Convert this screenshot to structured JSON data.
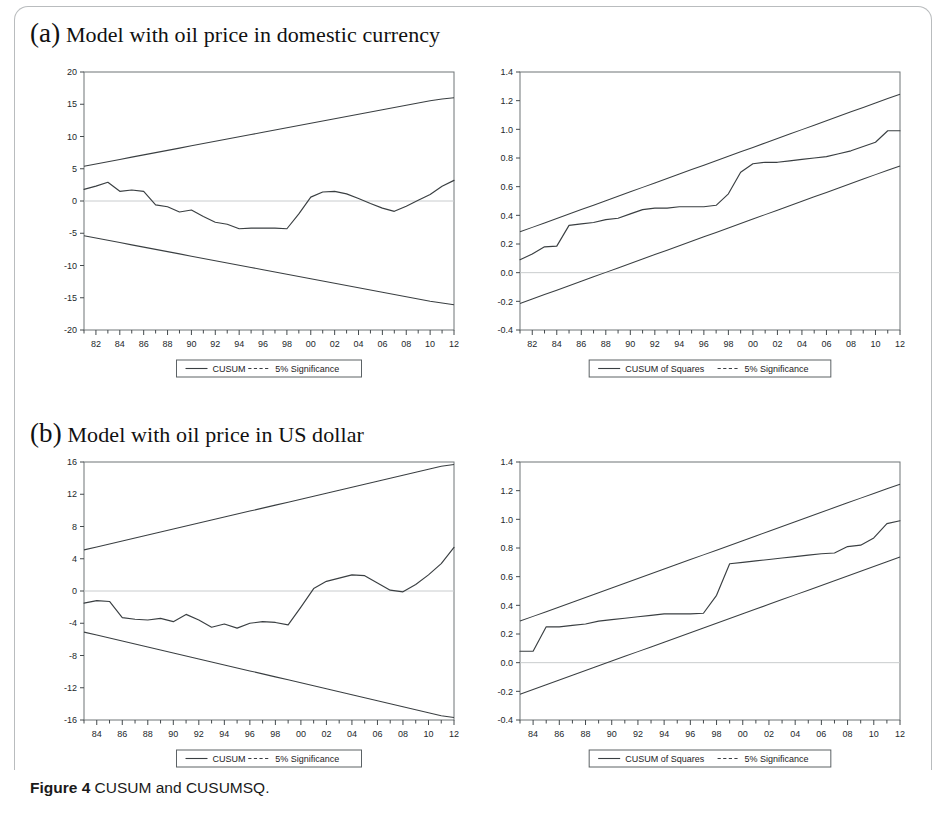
{
  "figure": {
    "caption_label": "Figure 4",
    "caption_text": "CUSUM and CUSUMSQ."
  },
  "panels": [
    {
      "key": "a",
      "marker": "(a)",
      "title": "Model with oil price in domestic currency"
    },
    {
      "key": "b",
      "marker": "(b)",
      "title": "Model with oil price in US dollar"
    }
  ],
  "chart_data": [
    {
      "id": "chart-a-left",
      "type": "line",
      "title": "",
      "panel": "(a) Model with oil price in domestic currency",
      "xlabel": "",
      "ylabel": "",
      "grid": false,
      "zero_line": true,
      "legend_position": "below",
      "xlim": [
        1981,
        2012
      ],
      "ylim": [
        -20,
        20
      ],
      "yticks": [
        20,
        15,
        10,
        5,
        0,
        -5,
        -10,
        -15,
        -20
      ],
      "ytick_labels": [
        "20",
        "15",
        "10",
        "5",
        "0",
        "-5",
        "-10",
        "-15",
        "-20"
      ],
      "xticks": [
        1981,
        1982,
        1983,
        1984,
        1985,
        1986,
        1987,
        1988,
        1989,
        1990,
        1991,
        1992,
        1993,
        1994,
        1995,
        1996,
        1997,
        1998,
        1999,
        2000,
        2001,
        2002,
        2003,
        2004,
        2005,
        2006,
        2007,
        2008,
        2009,
        2010,
        2011,
        2012
      ],
      "xtick_labels_major": [
        "82",
        "84",
        "86",
        "88",
        "90",
        "92",
        "94",
        "96",
        "98",
        "00",
        "02",
        "04",
        "06",
        "08",
        "10",
        "12"
      ],
      "xtick_major_values": [
        1982,
        1984,
        1986,
        1988,
        1990,
        1992,
        1994,
        1996,
        1998,
        2000,
        2002,
        2004,
        2006,
        2008,
        2010,
        2012
      ],
      "x": [
        1981,
        1982,
        1983,
        1984,
        1985,
        1986,
        1987,
        1988,
        1989,
        1990,
        1991,
        1992,
        1993,
        1994,
        1995,
        1996,
        1997,
        1998,
        1999,
        2000,
        2001,
        2002,
        2003,
        2004,
        2005,
        2006,
        2007,
        2008,
        2009,
        2010,
        2011,
        2012
      ],
      "series": [
        {
          "name": "CUSUM",
          "style": "solid",
          "values": [
            1.8,
            2.3,
            2.9,
            1.5,
            1.7,
            1.5,
            -0.6,
            -0.9,
            -1.7,
            -1.4,
            -2.4,
            -3.3,
            -3.6,
            -4.3,
            -4.2,
            -4.2,
            -4.2,
            -4.3,
            -2.0,
            0.6,
            1.4,
            1.5,
            1.1,
            0.4,
            -0.4,
            -1.1,
            -1.6,
            -0.8,
            0.1,
            1.0,
            2.3,
            3.2
          ]
        },
        {
          "name": "5% Significance (upper)",
          "style": "solid",
          "values": [
            5.4,
            5.75,
            6.1,
            6.45,
            6.8,
            7.15,
            7.5,
            7.85,
            8.2,
            8.55,
            8.9,
            9.25,
            9.6,
            9.95,
            10.3,
            10.65,
            11.0,
            11.35,
            11.7,
            12.05,
            12.4,
            12.75,
            13.1,
            13.45,
            13.8,
            14.15,
            14.5,
            14.85,
            15.2,
            15.55,
            15.8,
            16.0
          ]
        },
        {
          "name": "5% Significance (lower)",
          "style": "solid",
          "values": [
            -5.4,
            -5.75,
            -6.1,
            -6.45,
            -6.8,
            -7.15,
            -7.5,
            -7.85,
            -8.2,
            -8.55,
            -8.9,
            -9.25,
            -9.6,
            -9.95,
            -10.3,
            -10.65,
            -11.0,
            -11.35,
            -11.7,
            -12.05,
            -12.4,
            -12.75,
            -13.1,
            -13.45,
            -13.8,
            -14.15,
            -14.5,
            -14.85,
            -15.2,
            -15.55,
            -15.8,
            -16.1
          ]
        }
      ],
      "legend": [
        {
          "label": "CUSUM",
          "style": "solid"
        },
        {
          "label": "5% Significance",
          "style": "dashed"
        }
      ]
    },
    {
      "id": "chart-a-right",
      "type": "line",
      "title": "",
      "panel": "(a) Model with oil price in domestic currency",
      "xlabel": "",
      "ylabel": "",
      "grid": false,
      "zero_line": true,
      "legend_position": "below",
      "xlim": [
        1981,
        2012
      ],
      "ylim": [
        -0.4,
        1.4
      ],
      "yticks": [
        1.4,
        1.2,
        1.0,
        0.8,
        0.6,
        0.4,
        0.2,
        0.0,
        -0.2,
        -0.4
      ],
      "ytick_labels": [
        "1.4",
        "1.2",
        "1.0",
        "0.8",
        "0.6",
        "0.4",
        "0.2",
        "0.0",
        "-0.2",
        "-0.4"
      ],
      "xticks": [
        1981,
        1982,
        1983,
        1984,
        1985,
        1986,
        1987,
        1988,
        1989,
        1990,
        1991,
        1992,
        1993,
        1994,
        1995,
        1996,
        1997,
        1998,
        1999,
        2000,
        2001,
        2002,
        2003,
        2004,
        2005,
        2006,
        2007,
        2008,
        2009,
        2010,
        2011,
        2012
      ],
      "xtick_labels_major": [
        "82",
        "84",
        "86",
        "88",
        "90",
        "92",
        "94",
        "96",
        "98",
        "00",
        "02",
        "04",
        "06",
        "08",
        "10",
        "12"
      ],
      "xtick_major_values": [
        1982,
        1984,
        1986,
        1988,
        1990,
        1992,
        1994,
        1996,
        1998,
        2000,
        2002,
        2004,
        2006,
        2008,
        2010,
        2012
      ],
      "x": [
        1981,
        1982,
        1983,
        1984,
        1985,
        1986,
        1987,
        1988,
        1989,
        1990,
        1991,
        1992,
        1993,
        1994,
        1995,
        1996,
        1997,
        1998,
        1999,
        2000,
        2001,
        2002,
        2003,
        2004,
        2005,
        2006,
        2007,
        2008,
        2009,
        2010,
        2011,
        2012
      ],
      "series": [
        {
          "name": "CUSUM of Squares",
          "style": "solid",
          "values": [
            0.09,
            0.13,
            0.18,
            0.185,
            0.33,
            0.34,
            0.35,
            0.37,
            0.38,
            0.41,
            0.44,
            0.45,
            0.45,
            0.46,
            0.46,
            0.46,
            0.47,
            0.55,
            0.7,
            0.76,
            0.77,
            0.77,
            0.78,
            0.79,
            0.8,
            0.81,
            0.83,
            0.85,
            0.88,
            0.91,
            0.99,
            0.99
          ]
        },
        {
          "name": "5% Significance (upper)",
          "style": "solid",
          "values": [
            0.285,
            0.316,
            0.347,
            0.378,
            0.409,
            0.44,
            0.471,
            0.502,
            0.533,
            0.564,
            0.595,
            0.626,
            0.657,
            0.688,
            0.719,
            0.75,
            0.781,
            0.812,
            0.843,
            0.874,
            0.905,
            0.936,
            0.967,
            0.998,
            1.029,
            1.06,
            1.091,
            1.122,
            1.153,
            1.184,
            1.215,
            1.245
          ]
        },
        {
          "name": "5% Significance (lower)",
          "style": "solid",
          "values": [
            -0.215,
            -0.184,
            -0.153,
            -0.122,
            -0.091,
            -0.06,
            -0.029,
            0.002,
            0.033,
            0.064,
            0.095,
            0.126,
            0.157,
            0.188,
            0.219,
            0.25,
            0.281,
            0.312,
            0.343,
            0.374,
            0.405,
            0.436,
            0.467,
            0.498,
            0.529,
            0.56,
            0.591,
            0.622,
            0.653,
            0.684,
            0.715,
            0.745
          ]
        }
      ],
      "legend": [
        {
          "label": "CUSUM of Squares",
          "style": "solid"
        },
        {
          "label": "5% Significance",
          "style": "dashed"
        }
      ]
    },
    {
      "id": "chart-b-left",
      "type": "line",
      "title": "",
      "panel": "(b) Model with oil price in US dollar",
      "xlabel": "",
      "ylabel": "",
      "grid": false,
      "zero_line": true,
      "legend_position": "below",
      "xlim": [
        1983,
        2012
      ],
      "ylim": [
        -16,
        16
      ],
      "yticks": [
        16,
        12,
        8,
        4,
        0,
        -4,
        -8,
        -12,
        -16
      ],
      "ytick_labels": [
        "16",
        "12",
        "8",
        "4",
        "0",
        "-4",
        "-8",
        "-12",
        "-16"
      ],
      "xticks": [
        1983,
        1984,
        1985,
        1986,
        1987,
        1988,
        1989,
        1990,
        1991,
        1992,
        1993,
        1994,
        1995,
        1996,
        1997,
        1998,
        1999,
        2000,
        2001,
        2002,
        2003,
        2004,
        2005,
        2006,
        2007,
        2008,
        2009,
        2010,
        2011,
        2012
      ],
      "xtick_labels_major": [
        "84",
        "86",
        "88",
        "90",
        "92",
        "94",
        "96",
        "98",
        "00",
        "02",
        "04",
        "06",
        "08",
        "10",
        "12"
      ],
      "xtick_major_values": [
        1984,
        1986,
        1988,
        1990,
        1992,
        1994,
        1996,
        1998,
        2000,
        2002,
        2004,
        2006,
        2008,
        2010,
        2012
      ],
      "x": [
        1983,
        1984,
        1985,
        1986,
        1987,
        1988,
        1989,
        1990,
        1991,
        1992,
        1993,
        1994,
        1995,
        1996,
        1997,
        1998,
        1999,
        2000,
        2001,
        2002,
        2003,
        2004,
        2005,
        2006,
        2007,
        2008,
        2009,
        2010,
        2011,
        2012
      ],
      "series": [
        {
          "name": "CUSUM",
          "style": "solid",
          "values": [
            -1.5,
            -1.2,
            -1.3,
            -3.3,
            -3.5,
            -3.6,
            -3.4,
            -3.8,
            -2.9,
            -3.6,
            -4.5,
            -4.1,
            -4.6,
            -4.0,
            -3.8,
            -3.9,
            -4.2,
            -2.0,
            0.3,
            1.2,
            1.6,
            2.0,
            1.9,
            1.0,
            0.1,
            -0.1,
            0.8,
            2.0,
            3.4,
            5.4
          ]
        },
        {
          "name": "5% Significance (upper)",
          "style": "solid",
          "values": [
            5.1,
            5.47,
            5.84,
            6.21,
            6.58,
            6.95,
            7.32,
            7.69,
            8.06,
            8.43,
            8.8,
            9.17,
            9.54,
            9.91,
            10.28,
            10.65,
            11.02,
            11.39,
            11.76,
            12.13,
            12.5,
            12.87,
            13.24,
            13.61,
            13.98,
            14.35,
            14.72,
            15.09,
            15.46,
            15.7
          ]
        },
        {
          "name": "5% Significance (lower)",
          "style": "solid",
          "values": [
            -5.1,
            -5.47,
            -5.84,
            -6.21,
            -6.58,
            -6.95,
            -7.32,
            -7.69,
            -8.06,
            -8.43,
            -8.8,
            -9.17,
            -9.54,
            -9.91,
            -10.28,
            -10.65,
            -11.02,
            -11.39,
            -11.76,
            -12.13,
            -12.5,
            -12.87,
            -13.24,
            -13.61,
            -13.98,
            -14.35,
            -14.72,
            -15.09,
            -15.46,
            -15.7
          ]
        }
      ],
      "legend": [
        {
          "label": "CUSUM",
          "style": "solid"
        },
        {
          "label": "5% Significance",
          "style": "dashed"
        }
      ]
    },
    {
      "id": "chart-b-right",
      "type": "line",
      "title": "",
      "panel": "(b) Model with oil price in US dollar",
      "xlabel": "",
      "ylabel": "",
      "grid": false,
      "zero_line": true,
      "legend_position": "below",
      "xlim": [
        1983,
        2012
      ],
      "ylim": [
        -0.4,
        1.4
      ],
      "yticks": [
        1.4,
        1.2,
        1.0,
        0.8,
        0.6,
        0.4,
        0.2,
        0.0,
        -0.2,
        -0.4
      ],
      "ytick_labels": [
        "1.4",
        "1.2",
        "1.0",
        "0.8",
        "0.6",
        "0.4",
        "0.2",
        "0.0",
        "-0.2",
        "-0.4"
      ],
      "xticks": [
        1983,
        1984,
        1985,
        1986,
        1987,
        1988,
        1989,
        1990,
        1991,
        1992,
        1993,
        1994,
        1995,
        1996,
        1997,
        1998,
        1999,
        2000,
        2001,
        2002,
        2003,
        2004,
        2005,
        2006,
        2007,
        2008,
        2009,
        2010,
        2011,
        2012
      ],
      "xtick_labels_major": [
        "84",
        "86",
        "88",
        "90",
        "92",
        "94",
        "96",
        "98",
        "00",
        "02",
        "04",
        "06",
        "08",
        "10",
        "12"
      ],
      "xtick_major_values": [
        1984,
        1986,
        1988,
        1990,
        1992,
        1994,
        1996,
        1998,
        2000,
        2002,
        2004,
        2006,
        2008,
        2010,
        2012
      ],
      "x": [
        1983,
        1984,
        1985,
        1986,
        1987,
        1988,
        1989,
        1990,
        1991,
        1992,
        1993,
        1994,
        1995,
        1996,
        1997,
        1998,
        1999,
        2000,
        2001,
        2002,
        2003,
        2004,
        2005,
        2006,
        2007,
        2008,
        2009,
        2010,
        2011,
        2012
      ],
      "series": [
        {
          "name": "CUSUM of Squares",
          "style": "solid",
          "values": [
            0.08,
            0.08,
            0.25,
            0.25,
            0.26,
            0.27,
            0.29,
            0.3,
            0.31,
            0.32,
            0.33,
            0.34,
            0.34,
            0.34,
            0.345,
            0.47,
            0.69,
            0.7,
            0.71,
            0.72,
            0.73,
            0.74,
            0.75,
            0.76,
            0.765,
            0.81,
            0.82,
            0.87,
            0.97,
            0.99
          ]
        },
        {
          "name": "5% Significance (upper)",
          "style": "solid",
          "values": [
            0.29,
            0.323,
            0.356,
            0.389,
            0.422,
            0.455,
            0.488,
            0.521,
            0.554,
            0.587,
            0.62,
            0.653,
            0.686,
            0.719,
            0.752,
            0.785,
            0.818,
            0.851,
            0.884,
            0.917,
            0.95,
            0.983,
            1.016,
            1.049,
            1.082,
            1.115,
            1.148,
            1.181,
            1.214,
            1.245
          ]
        },
        {
          "name": "5% Significance (lower)",
          "style": "solid",
          "values": [
            -0.22,
            -0.187,
            -0.154,
            -0.121,
            -0.088,
            -0.055,
            -0.022,
            0.011,
            0.044,
            0.077,
            0.11,
            0.143,
            0.176,
            0.209,
            0.242,
            0.275,
            0.308,
            0.341,
            0.374,
            0.407,
            0.44,
            0.473,
            0.506,
            0.539,
            0.572,
            0.605,
            0.638,
            0.671,
            0.704,
            0.738
          ]
        }
      ],
      "legend": [
        {
          "label": "CUSUM of Squares",
          "style": "solid"
        },
        {
          "label": "5% Significance",
          "style": "dashed"
        }
      ]
    }
  ],
  "colors": {
    "line": "#3a3f42",
    "axis": "#444a4d",
    "frame": "#6e7477",
    "zero": "#c9ccce",
    "page_border": "#b9bcbe",
    "text": "#1a1a1a"
  }
}
